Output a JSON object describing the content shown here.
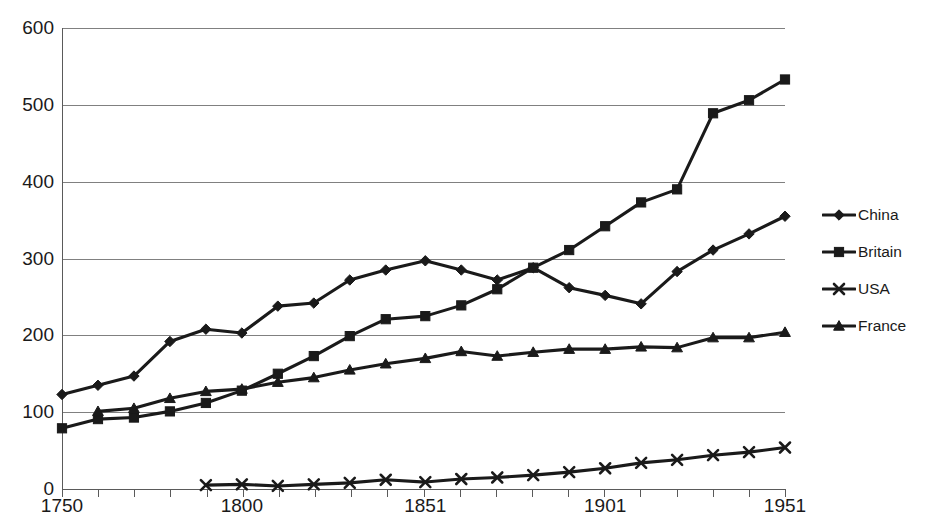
{
  "chart_data": {
    "type": "line",
    "title": "",
    "subtitle": "",
    "xlabel": "",
    "ylabel": "",
    "xlim": [
      1750,
      1951
    ],
    "ylim": [
      0,
      600
    ],
    "grid": true,
    "legend_position": "right",
    "y_ticks": [
      600,
      500,
      400,
      300,
      200,
      100,
      0
    ],
    "x_tick_labels": [
      "1750",
      "1800",
      "1851",
      "1901",
      "1951"
    ],
    "x_tick_values": [
      1750,
      1800,
      1851,
      1901,
      1951
    ],
    "x_minor_tick_count": 21,
    "series": [
      {
        "name": "China",
        "marker": "diamond",
        "x": [
          1750,
          1760,
          1770,
          1780,
          1790,
          1800,
          1810,
          1820,
          1830,
          1840,
          1851,
          1861,
          1871,
          1881,
          1891,
          1901,
          1911,
          1921,
          1931,
          1941,
          1951
        ],
        "values": [
          123,
          135,
          147,
          192,
          208,
          203,
          238,
          242,
          272,
          285,
          297,
          285,
          272,
          288,
          262,
          252,
          241,
          283,
          311,
          332,
          355
        ]
      },
      {
        "name": "Britain",
        "marker": "square",
        "x": [
          1750,
          1760,
          1770,
          1780,
          1790,
          1800,
          1810,
          1820,
          1830,
          1840,
          1851,
          1861,
          1871,
          1881,
          1891,
          1901,
          1911,
          1921,
          1931,
          1941,
          1951
        ],
        "values": [
          79,
          91,
          93,
          101,
          112,
          128,
          150,
          173,
          199,
          221,
          225,
          239,
          260,
          288,
          311,
          342,
          373,
          390,
          489,
          506,
          533
        ]
      },
      {
        "name": "USA",
        "marker": "x",
        "x": [
          1790,
          1800,
          1810,
          1820,
          1830,
          1840,
          1851,
          1861,
          1871,
          1881,
          1891,
          1901,
          1911,
          1921,
          1931,
          1941,
          1951
        ],
        "values": [
          5,
          6,
          4,
          6,
          8,
          12,
          9,
          13,
          15,
          18,
          22,
          27,
          34,
          38,
          44,
          48,
          54
        ]
      },
      {
        "name": "France",
        "marker": "triangle",
        "x": [
          1760,
          1770,
          1780,
          1790,
          1800,
          1810,
          1820,
          1830,
          1840,
          1851,
          1861,
          1871,
          1881,
          1891,
          1901,
          1911,
          1921,
          1931,
          1941,
          1951
        ],
        "values": [
          101,
          105,
          118,
          127,
          130,
          139,
          145,
          155,
          163,
          170,
          179,
          173,
          178,
          182,
          182,
          185,
          184,
          197,
          197,
          204
        ]
      }
    ]
  },
  "legend": {
    "items": [
      {
        "label": "China",
        "marker": "diamond"
      },
      {
        "label": "Britain",
        "marker": "square"
      },
      {
        "label": "USA",
        "marker": "x"
      },
      {
        "label": "France",
        "marker": "triangle"
      }
    ]
  },
  "colors": {
    "series": "#1a1a1a",
    "gridline": "#808080",
    "axis": "#5a5a5a",
    "background": "#ffffff"
  }
}
